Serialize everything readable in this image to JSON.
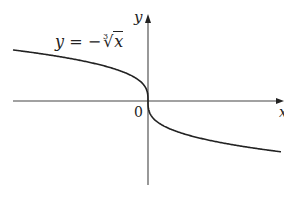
{
  "chart_data": {
    "type": "line",
    "title": "",
    "function": "y = -cbrt(x)",
    "series": [
      {
        "name": "y = −∛x",
        "x": [
          -8,
          -6,
          -4,
          -3,
          -2,
          -1,
          -0.5,
          -0.1,
          0,
          0.1,
          0.5,
          1,
          2,
          3,
          4,
          6,
          8
        ],
        "values": [
          2,
          1.817,
          1.587,
          1.442,
          1.26,
          1,
          0.794,
          0.464,
          0,
          -0.464,
          -0.794,
          -1,
          -1.26,
          -1.442,
          -1.587,
          -1.817,
          -2
        ]
      }
    ],
    "xlabel": "x",
    "ylabel": "y",
    "origin_label": "0",
    "grid": false,
    "legend": "none",
    "annotations": [
      "y = −∛x"
    ],
    "colors": {
      "curve": "#222222",
      "axes": "#444444"
    }
  },
  "labels": {
    "equation_y": "y",
    "equation_eq": " = −",
    "equation_index": "3",
    "equation_radical": "√",
    "equation_radicand": "x",
    "y_axis": "y",
    "x_axis": "x",
    "origin": "0"
  }
}
